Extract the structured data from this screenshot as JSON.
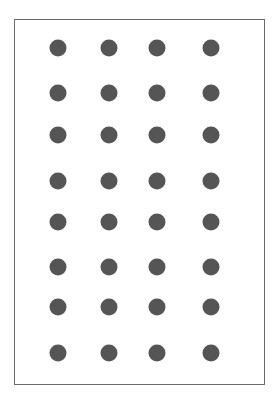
{
  "diagram": {
    "type": "dot-grid",
    "rows": 8,
    "columns": 4,
    "total_dots": 32,
    "dot_color": "#555555",
    "border_color": "#6b6b6b",
    "column_x": [
      58,
      109,
      157,
      211
    ],
    "row_y": [
      48,
      93,
      135,
      181,
      222,
      267,
      307,
      353
    ]
  }
}
